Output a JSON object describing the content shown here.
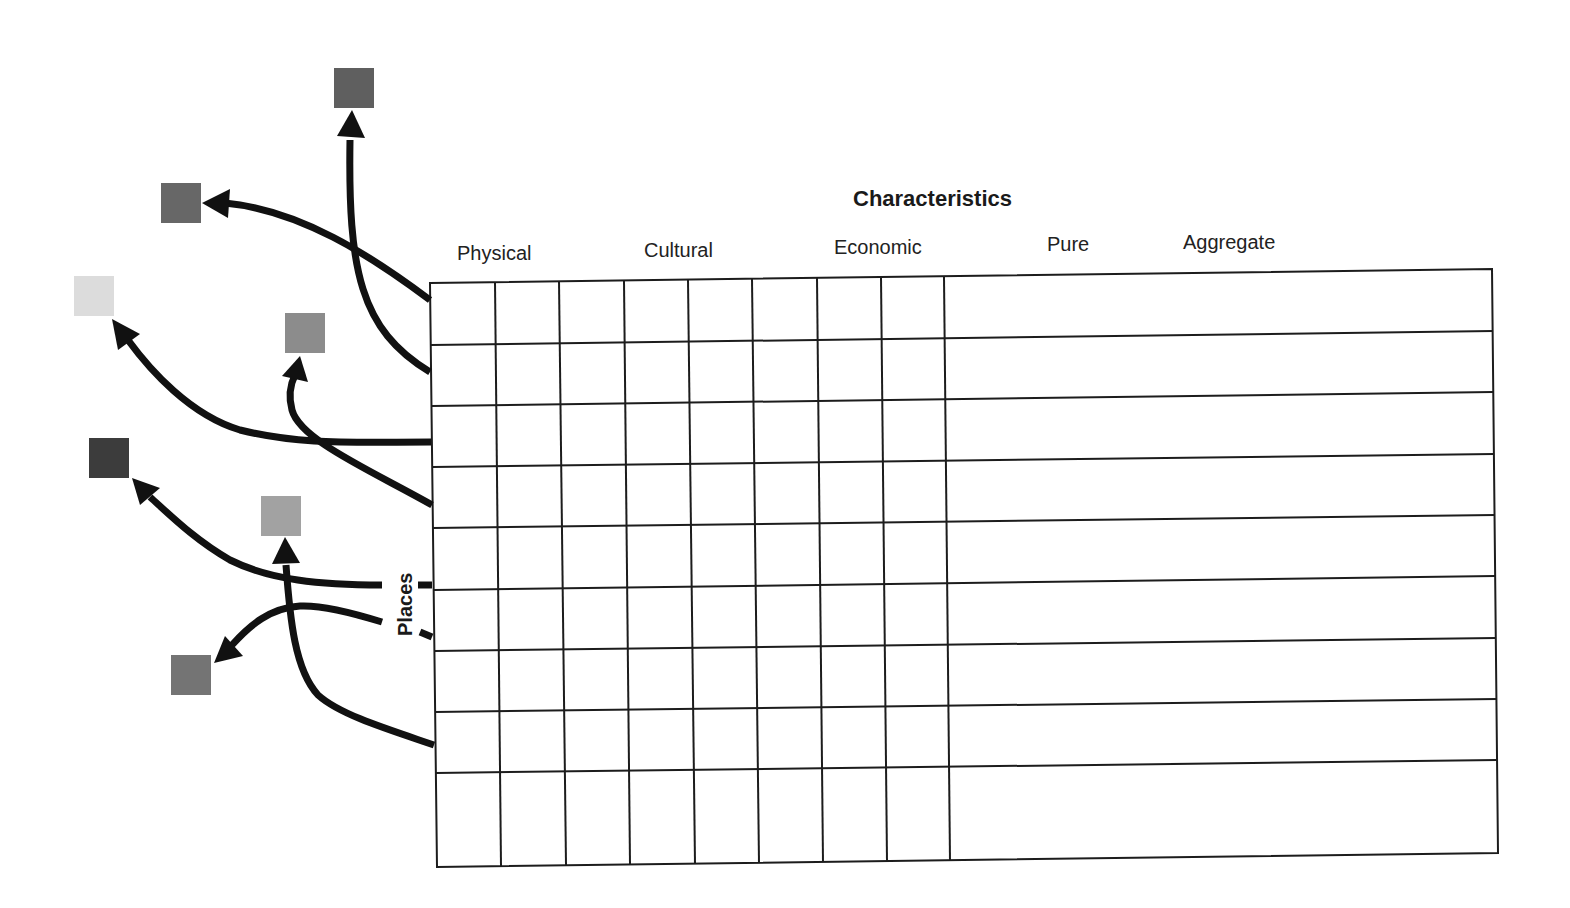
{
  "diagram": {
    "title": "Characteristics",
    "row_label": "Places",
    "column_headers": [
      {
        "label": "Physical",
        "x": 457,
        "y": 260
      },
      {
        "label": "Cultural",
        "x": 644,
        "y": 257
      },
      {
        "label": "Economic",
        "x": 834,
        "y": 254
      },
      {
        "label": "Pure",
        "x": 1047,
        "y": 251
      },
      {
        "label": "Aggregate",
        "x": 1183,
        "y": 249
      }
    ],
    "grid": {
      "rows": 9,
      "narrow_columns": 8,
      "wide_columns": 1,
      "cells": "empty"
    },
    "squares": [
      {
        "id": "square-top",
        "x": 334,
        "y": 68,
        "size": 40,
        "color": "#5f5f5f"
      },
      {
        "id": "square-upper-left",
        "x": 161,
        "y": 183,
        "size": 40,
        "color": "#676767"
      },
      {
        "id": "square-light",
        "x": 74,
        "y": 276,
        "size": 40,
        "color": "#dcdcdc"
      },
      {
        "id": "square-middle",
        "x": 285,
        "y": 313,
        "size": 40,
        "color": "#8c8c8c"
      },
      {
        "id": "square-dark",
        "x": 89,
        "y": 438,
        "size": 40,
        "color": "#3c3c3c"
      },
      {
        "id": "square-center-light",
        "x": 261,
        "y": 496,
        "size": 40,
        "color": "#a2a2a2"
      },
      {
        "id": "square-bottom",
        "x": 171,
        "y": 655,
        "size": 40,
        "color": "#747474"
      }
    ],
    "arrows": [
      {
        "from": "row-1",
        "to": "square-upper-left"
      },
      {
        "from": "row-2",
        "to": "square-top"
      },
      {
        "from": "row-3",
        "to": "square-light"
      },
      {
        "from": "row-4",
        "to": "square-middle"
      },
      {
        "from": "row-5",
        "to": "square-dark"
      },
      {
        "from": "row-6",
        "to": "square-bottom"
      },
      {
        "from": "row-8",
        "to": "square-center-light"
      }
    ],
    "colors": {
      "line": "#1c1c1c",
      "arrow": "#111111",
      "background": "#ffffff"
    }
  }
}
